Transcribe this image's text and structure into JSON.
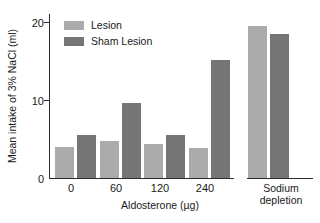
{
  "chart_data": {
    "type": "bar",
    "title": "",
    "xlabel": "Aldosterone (µg)",
    "ylabel": "Mean intake of 3% NaCl (ml)",
    "ylim": [
      0,
      21
    ],
    "yticks": [
      0,
      10,
      20
    ],
    "ytick_labels": [
      "0",
      "10",
      "20"
    ],
    "grid": false,
    "legend_position": "upper-left-inside",
    "categories": [
      "0",
      "60",
      "120",
      "240",
      "Sodium depletion"
    ],
    "axis_break_before_last_group": true,
    "series": [
      {
        "name": "Lesion",
        "color": "#ababab",
        "values": [
          4.0,
          4.8,
          4.4,
          3.9,
          19.5
        ]
      },
      {
        "name": "Sham Lesion",
        "color": "#757575",
        "values": [
          5.5,
          9.6,
          5.5,
          15.1,
          18.5
        ]
      }
    ]
  },
  "axis": {
    "y_title": "Mean intake of 3% NaCl (ml)",
    "x_title": "Aldosterone (µg)",
    "y_labels": [
      "20",
      "10",
      "0"
    ],
    "x_labels": [
      "0",
      "60",
      "120",
      "240"
    ],
    "group_label_sodium_line1": "Sodium",
    "group_label_sodium_line2": "depletion"
  },
  "legend": {
    "items": [
      {
        "label": "Lesion"
      },
      {
        "label": "Sham Lesion"
      }
    ]
  }
}
